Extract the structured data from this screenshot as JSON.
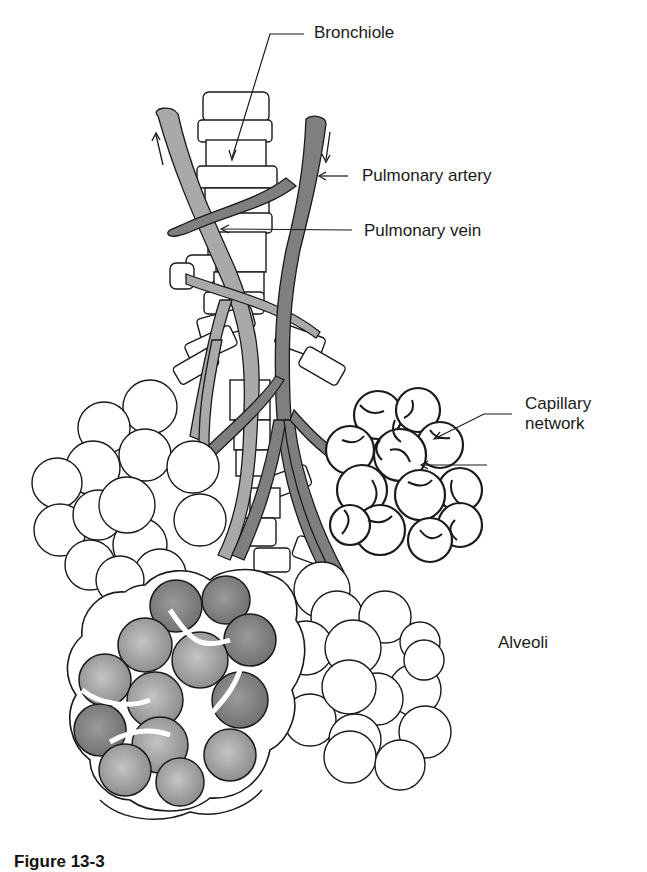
{
  "figure": {
    "caption_visible": "Figure 13-3"
  },
  "labels": {
    "bronchiole": "Bronchiole",
    "pulmonary_artery": "Pulmonary artery",
    "pulmonary_vein": "Pulmonary vein",
    "capillary_network_line1": "Capillary",
    "capillary_network_line2": "network",
    "alveoli": "Alveoli"
  },
  "colors": {
    "background": "#ffffff",
    "outline": "#1a1a1a",
    "pulmonary_vein_fill": "#a9a9a9",
    "pulmonary_artery_fill": "#7f7f7f",
    "alveoli_gray_fill": "#8c8c8c",
    "alveoli_light_gray_fill": "#b5b5b5",
    "bronchiole_fill": "#ffffff"
  }
}
